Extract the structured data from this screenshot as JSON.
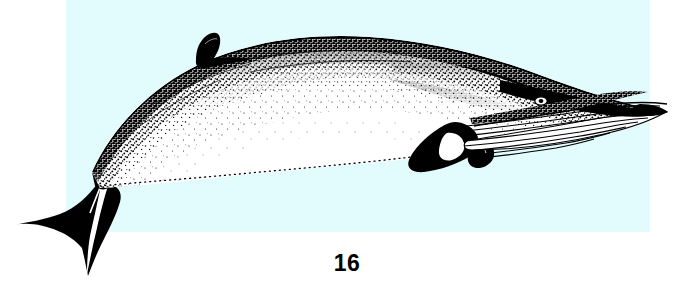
{
  "plate": {
    "figure_number": "16",
    "background_color": "#e2fbfc",
    "page_color": "#ffffff",
    "ink_color": "#000000"
  },
  "illustration": {
    "subject_name": "minke-whale",
    "style": "stipple-engraving",
    "orientation": "lateral-view-facing-right",
    "parts": [
      {
        "name": "dorsal-fin",
        "label": "dorsal fin"
      },
      {
        "name": "tail-flukes",
        "label": "tail flukes"
      },
      {
        "name": "caudal-peduncle",
        "label": "tail stock"
      },
      {
        "name": "pectoral-flipper",
        "label": "pectoral flipper"
      },
      {
        "name": "flipper-white-band",
        "label": "white flipper band"
      },
      {
        "name": "eye",
        "label": "eye"
      },
      {
        "name": "rostrum",
        "label": "rostrum"
      },
      {
        "name": "throat-grooves",
        "label": "ventral throat grooves"
      },
      {
        "name": "blowhole-ridge",
        "label": "head ridge"
      },
      {
        "name": "ventral-white-field",
        "label": "pale underside"
      },
      {
        "name": "dark-dorsal-field",
        "label": "dark back"
      }
    ]
  }
}
